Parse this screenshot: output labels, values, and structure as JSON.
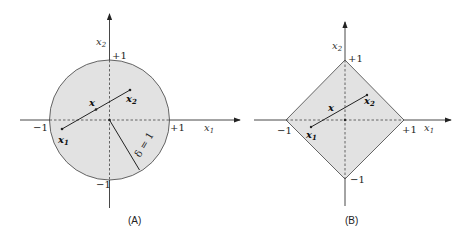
{
  "panels": [
    {
      "id": "A",
      "caption": "(A)",
      "shape": "circle",
      "axis_x_label": "x",
      "axis_x_sub": "1",
      "axis_y_label": "x",
      "axis_y_sub": "2",
      "ticks": {
        "top": "+1",
        "bottom": "−1",
        "left": "−1",
        "right": "+1"
      },
      "points": {
        "x1": "x",
        "x1_sub": "1",
        "x2": "x",
        "x2_sub": "2",
        "x": "x"
      },
      "radius_label": "δ = 1"
    },
    {
      "id": "B",
      "caption": "(B)",
      "shape": "diamond",
      "axis_x_label": "x",
      "axis_x_sub": "1",
      "axis_y_label": "x",
      "axis_y_sub": "2",
      "ticks": {
        "top": "+1",
        "bottom": "−1",
        "left": "−1",
        "right": "+1"
      },
      "points": {
        "x1": "x",
        "x1_sub": "1",
        "x2": "x",
        "x2_sub": "2",
        "x": "x"
      }
    }
  ],
  "colors": {
    "fill": "#e2e2e2",
    "stroke": "#555555",
    "axis": "#333333"
  }
}
